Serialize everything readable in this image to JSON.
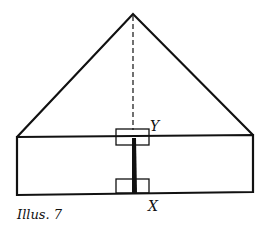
{
  "diagram": {
    "caption": "Illus. 7",
    "labels": {
      "top_joint": "Y",
      "bottom_joint": "X"
    },
    "colors": {
      "stroke": "#111111",
      "background": "#ffffff"
    },
    "shapes": {
      "roof_triangle": {
        "apex": [
          133,
          14
        ],
        "left": [
          17,
          137
        ],
        "right": [
          253,
          135
        ]
      },
      "wall_rectangle": {
        "top_left": [
          17,
          137
        ],
        "top_right": [
          253,
          135
        ],
        "bottom_right": [
          253,
          192
        ],
        "bottom_left": [
          17,
          195
        ]
      },
      "center_dashed_line": {
        "from": [
          133,
          14
        ],
        "to": [
          133,
          137
        ]
      },
      "king_post": {
        "from": [
          134,
          137
        ],
        "to": [
          134,
          193
        ]
      },
      "top_bracket_box": {
        "x": 116,
        "y": 129,
        "w": 33,
        "h": 16
      },
      "bottom_bracket_box": {
        "x": 116,
        "y": 179,
        "w": 33,
        "h": 14
      }
    }
  }
}
